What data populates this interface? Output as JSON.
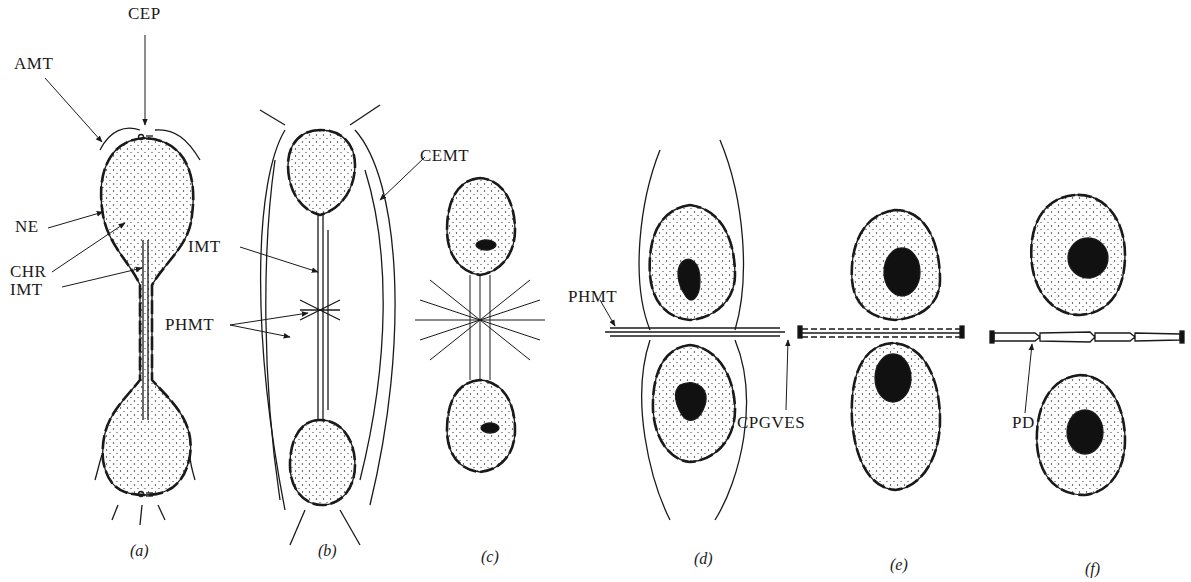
{
  "diagram": {
    "panels": [
      {
        "id": "a",
        "caption": "(a)"
      },
      {
        "id": "b",
        "caption": "(b)"
      },
      {
        "id": "c",
        "caption": "(c)"
      },
      {
        "id": "d",
        "caption": "(d)"
      },
      {
        "id": "e",
        "caption": "(e)"
      },
      {
        "id": "f",
        "caption": "(f)"
      }
    ],
    "labels": {
      "cep": "CEP",
      "amt": "AMT",
      "ne": "NE",
      "chr": "CHR",
      "imt_a": "IMT",
      "imt_b": "IMT",
      "phmt_b": "PHMT",
      "cemt": "CEMT",
      "phmt_d": "PHMT",
      "cpgves": "CPGVES",
      "pd": "PD"
    },
    "colors": {
      "ink": "#1a1a1a",
      "background": "#ffffff",
      "nucleus_fill": "#111111"
    }
  }
}
